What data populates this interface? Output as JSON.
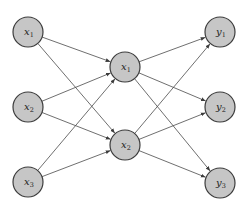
{
  "diagram": {
    "type": "neural-network",
    "colors": {
      "node_fill": "#c6c6c6",
      "node_stroke": "#3c3c3c",
      "edge": "#4a4a4a",
      "text": "#222222"
    },
    "layers": [
      {
        "name": "input",
        "nodes": [
          {
            "id": "x1",
            "label": "x",
            "sub": "1",
            "cx": 28,
            "cy": 32
          },
          {
            "id": "x2",
            "label": "x",
            "sub": "2",
            "cx": 28,
            "cy": 107
          },
          {
            "id": "x3",
            "label": "x",
            "sub": "3",
            "cx": 28,
            "cy": 182
          }
        ]
      },
      {
        "name": "hidden",
        "nodes": [
          {
            "id": "X1",
            "label": "x",
            "sub": "1",
            "cx": 125,
            "cy": 67
          },
          {
            "id": "X2",
            "label": "x",
            "sub": "2",
            "cx": 125,
            "cy": 145
          }
        ]
      },
      {
        "name": "output",
        "nodes": [
          {
            "id": "y1",
            "label": "y",
            "sub": "1",
            "cx": 220,
            "cy": 32
          },
          {
            "id": "y2",
            "label": "y",
            "sub": "2",
            "cx": 220,
            "cy": 107
          },
          {
            "id": "y3",
            "label": "y",
            "sub": "3",
            "cx": 220,
            "cy": 183
          }
        ]
      }
    ],
    "node_radius": 15,
    "edges": [
      {
        "from": "x1",
        "to": "X1"
      },
      {
        "from": "x1",
        "to": "X2"
      },
      {
        "from": "x2",
        "to": "X1"
      },
      {
        "from": "x2",
        "to": "X2"
      },
      {
        "from": "x3",
        "to": "X1"
      },
      {
        "from": "x3",
        "to": "X2"
      },
      {
        "from": "X1",
        "to": "y1"
      },
      {
        "from": "X1",
        "to": "y2"
      },
      {
        "from": "X1",
        "to": "y3"
      },
      {
        "from": "X2",
        "to": "y1"
      },
      {
        "from": "X2",
        "to": "y2"
      },
      {
        "from": "X2",
        "to": "y3"
      }
    ]
  }
}
